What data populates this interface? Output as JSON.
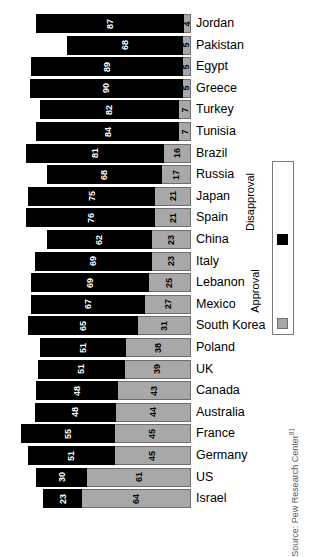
{
  "chart_data": {
    "type": "bar",
    "subtype": "horizontal-stacked-bar",
    "title": "",
    "xlabel": "",
    "ylabel": "",
    "xlim": [
      0,
      100
    ],
    "grid": false,
    "orientation": "horizontal",
    "stacked": true,
    "bar_alignment": "right-aligned",
    "legend": {
      "position": "right",
      "orientation": "vertical",
      "entries": [
        {
          "name": "Disapproval",
          "color": "#000000"
        },
        {
          "name": "Approval",
          "color": "#a8a8a8"
        }
      ]
    },
    "series": [
      {
        "name": "Disapproval",
        "color": "#000000",
        "values": [
          87,
          68,
          89,
          90,
          82,
          84,
          81,
          68,
          75,
          76,
          62,
          69,
          69,
          67,
          65,
          51,
          51,
          48,
          48,
          55,
          51,
          30,
          23
        ]
      },
      {
        "name": "Approval",
        "color": "#a8a8a8",
        "values": [
          4,
          5,
          5,
          5,
          7,
          7,
          16,
          17,
          21,
          21,
          23,
          23,
          25,
          27,
          31,
          38,
          39,
          43,
          44,
          45,
          45,
          61,
          64
        ]
      }
    ],
    "categories": [
      "Jordan",
      "Pakistan",
      "Egypt",
      "Greece",
      "Turkey",
      "Tunisia",
      "Brazil",
      "Russia",
      "Japan",
      "Spain",
      "China",
      "Italy",
      "Lebanon",
      "Mexico",
      "South Korea",
      "Poland",
      "UK",
      "Canada",
      "Australia",
      "France",
      "Germany",
      "US",
      "Israel"
    ],
    "rows": [
      {
        "country": "Jordan",
        "disapproval": 87,
        "approval": 4
      },
      {
        "country": "Pakistan",
        "disapproval": 68,
        "approval": 5
      },
      {
        "country": "Egypt",
        "disapproval": 89,
        "approval": 5
      },
      {
        "country": "Greece",
        "disapproval": 90,
        "approval": 5
      },
      {
        "country": "Turkey",
        "disapproval": 82,
        "approval": 7
      },
      {
        "country": "Tunisia",
        "disapproval": 84,
        "approval": 7
      },
      {
        "country": "Brazil",
        "disapproval": 81,
        "approval": 16
      },
      {
        "country": "Russia",
        "disapproval": 68,
        "approval": 17
      },
      {
        "country": "Japan",
        "disapproval": 75,
        "approval": 21
      },
      {
        "country": "Spain",
        "disapproval": 76,
        "approval": 21
      },
      {
        "country": "China",
        "disapproval": 62,
        "approval": 23
      },
      {
        "country": "Italy",
        "disapproval": 69,
        "approval": 23
      },
      {
        "country": "Lebanon",
        "disapproval": 69,
        "approval": 25
      },
      {
        "country": "Mexico",
        "disapproval": 67,
        "approval": 27
      },
      {
        "country": "South Korea",
        "disapproval": 65,
        "approval": 31
      },
      {
        "country": "Poland",
        "disapproval": 51,
        "approval": 38
      },
      {
        "country": "UK",
        "disapproval": 51,
        "approval": 39
      },
      {
        "country": "Canada",
        "disapproval": 48,
        "approval": 43
      },
      {
        "country": "Australia",
        "disapproval": 48,
        "approval": 44
      },
      {
        "country": "France",
        "disapproval": 55,
        "approval": 45
      },
      {
        "country": "Germany",
        "disapproval": 51,
        "approval": 45
      },
      {
        "country": "US",
        "disapproval": 30,
        "approval": 61
      },
      {
        "country": "Israel",
        "disapproval": 23,
        "approval": 64
      }
    ]
  },
  "source": {
    "label": "Source: Pew Research Center",
    "footnote_marker": "81"
  },
  "colors": {
    "disapproval": "#000000",
    "approval": "#a8a8a8",
    "approval_border": "#6e6e6e",
    "background": "#ffffff",
    "text": "#000000",
    "source_text": "#5a5a5a"
  }
}
